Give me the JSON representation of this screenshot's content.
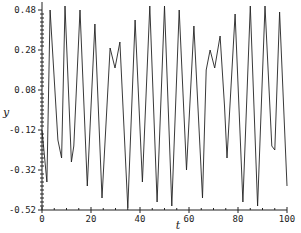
{
  "chart_data": {
    "type": "line",
    "title": "",
    "xlabel": "t",
    "ylabel": "y",
    "xlim": [
      0,
      100
    ],
    "ylim": [
      -0.52,
      0.52
    ],
    "x_ticks": [
      0,
      20,
      40,
      60,
      80,
      100
    ],
    "x_tick_labels": [
      "0",
      "20",
      "40",
      "60",
      "80",
      "100"
    ],
    "y_ticks": [
      0.48,
      0.28,
      0.08,
      -0.12,
      -0.32,
      -0.52
    ],
    "y_tick_labels": [
      "0.48",
      "0.28",
      "0.08",
      "-0.12",
      "-0.32",
      "-0.52"
    ],
    "grid": false,
    "legend": null,
    "series": [
      {
        "name": "y(t)",
        "color": "#222222",
        "x": [
          0,
          2.0,
          3.3,
          6.5,
          8.0,
          9.4,
          12.0,
          13.0,
          15.5,
          18.5,
          21.6,
          24.5,
          27.8,
          29.8,
          31.8,
          35.0,
          38.0,
          41.0,
          44.0,
          47.0,
          50.0,
          53.0,
          56.0,
          59.0,
          62.0,
          65.5,
          67.0,
          68.6,
          70.5,
          72.7,
          74.5,
          75.5,
          78.8,
          82.0,
          85.0,
          88.0,
          91.0,
          93.8,
          95.0,
          97.0,
          100.0
        ],
        "y": [
          -0.12,
          -0.38,
          0.48,
          -0.17,
          -0.26,
          0.5,
          -0.28,
          -0.2,
          0.48,
          -0.4,
          0.41,
          -0.46,
          0.29,
          0.19,
          0.32,
          -0.51,
          0.43,
          -0.38,
          0.5,
          -0.48,
          0.5,
          -0.5,
          0.48,
          -0.32,
          0.4,
          -0.46,
          0.18,
          0.28,
          0.19,
          0.35,
          0.0,
          -0.26,
          0.46,
          -0.48,
          0.5,
          -0.5,
          0.5,
          -0.2,
          -0.22,
          0.47,
          -0.4
        ]
      }
    ]
  }
}
